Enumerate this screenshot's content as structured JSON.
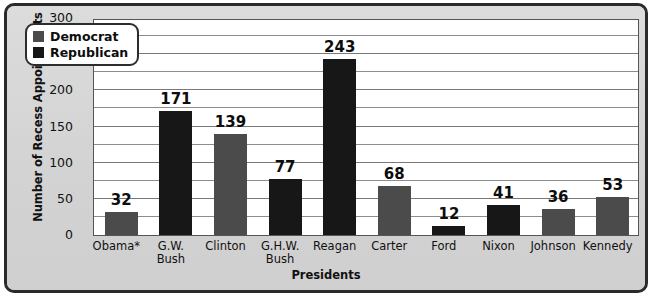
{
  "chart_data": {
    "type": "bar",
    "title": "",
    "xlabel": "Presidents",
    "ylabel": "Number of Recess Appointments",
    "categories": [
      "Obama*",
      "G.W. Bush",
      "Clinton",
      "G.H.W. Bush",
      "Reagan",
      "Carter",
      "Ford",
      "Nixon",
      "Johnson",
      "Kennedy"
    ],
    "values": [
      32,
      171,
      139,
      77,
      243,
      68,
      12,
      41,
      36,
      53
    ],
    "series": [
      {
        "name": "Recess Appointments",
        "values": [
          32,
          171,
          139,
          77,
          243,
          68,
          12,
          41,
          36,
          53
        ]
      }
    ],
    "party": [
      "Democrat",
      "Republican",
      "Democrat",
      "Republican",
      "Republican",
      "Democrat",
      "Republican",
      "Republican",
      "Democrat",
      "Democrat"
    ],
    "ylim": [
      0,
      300
    ],
    "yticks": [
      0,
      50,
      100,
      150,
      200,
      250,
      300
    ],
    "ytick_labels": [
      "0",
      "50",
      "100",
      "150",
      "200",
      "250",
      "300"
    ],
    "gridline_interval": 25,
    "grid": true,
    "legend": {
      "position": "top-left",
      "entries": [
        {
          "label": "Democrat",
          "color": "#4b4b4b"
        },
        {
          "label": "Republican",
          "color": "#171717"
        }
      ]
    },
    "bars": [
      {
        "label": "Obama*",
        "label_lines": [
          "Obama*"
        ],
        "value": 32,
        "party": "Democrat",
        "color": "#4b4b4b"
      },
      {
        "label": "G.W. Bush",
        "label_lines": [
          "G.W.",
          "Bush"
        ],
        "value": 171,
        "party": "Republican",
        "color": "#171717"
      },
      {
        "label": "Clinton",
        "label_lines": [
          "Clinton"
        ],
        "value": 139,
        "party": "Democrat",
        "color": "#4b4b4b"
      },
      {
        "label": "G.H.W. Bush",
        "label_lines": [
          "G.H.W.",
          "Bush"
        ],
        "value": 77,
        "party": "Republican",
        "color": "#171717"
      },
      {
        "label": "Reagan",
        "label_lines": [
          "Reagan"
        ],
        "value": 243,
        "party": "Republican",
        "color": "#171717"
      },
      {
        "label": "Carter",
        "label_lines": [
          "Carter"
        ],
        "value": 68,
        "party": "Democrat",
        "color": "#4b4b4b"
      },
      {
        "label": "Ford",
        "label_lines": [
          "Ford"
        ],
        "value": 12,
        "party": "Republican",
        "color": "#171717"
      },
      {
        "label": "Nixon",
        "label_lines": [
          "Nixon"
        ],
        "value": 41,
        "party": "Republican",
        "color": "#171717"
      },
      {
        "label": "Johnson",
        "label_lines": [
          "Johnson"
        ],
        "value": 36,
        "party": "Democrat",
        "color": "#4b4b4b"
      },
      {
        "label": "Kennedy",
        "label_lines": [
          "Kennedy"
        ],
        "value": 53,
        "party": "Democrat",
        "color": "#4b4b4b"
      }
    ]
  },
  "colors": {
    "democrat": "#4b4b4b",
    "republican": "#171717",
    "plot_background": "#ffffff",
    "page_background": "#d6d6d6",
    "gridline": "#8d8d8d",
    "text": "#111111"
  }
}
